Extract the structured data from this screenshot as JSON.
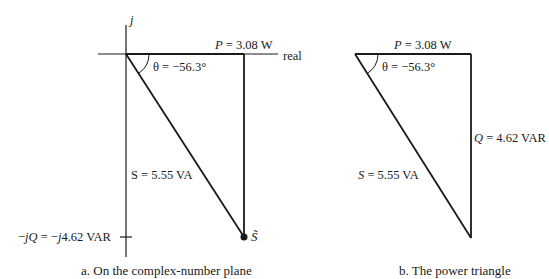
{
  "figure_a": {
    "axis_imag_label": "j",
    "axis_real_label": "real",
    "p_label_var": "P",
    "p_label_val": " = 3.08 W",
    "theta_label": "θ = −56.3°",
    "s_label": "S = 5.55 VA",
    "q_label_prefix": "−",
    "q_label_jq": "jQ",
    "q_label_mid": " = −",
    "q_label_j": "j",
    "q_label_val": "4.62 VAR",
    "s_point_label": "S̃",
    "caption": "a. On the complex-number plane"
  },
  "figure_b": {
    "p_label_var": "P",
    "p_label_val": " = 3.08 W",
    "theta_label": "θ = −56.3°",
    "q_label_var": "Q",
    "q_label_val": " = 4.62 VAR",
    "s_label_var": "S",
    "s_label_val": " = 5.55 VA",
    "caption": "b. The power triangle"
  },
  "values": {
    "P_W": 3.08,
    "Q_VAR": 4.62,
    "S_VA": 5.55,
    "theta_deg": -56.3
  },
  "colors": {
    "line": "#1a1a1a",
    "background": "#ffffff"
  }
}
